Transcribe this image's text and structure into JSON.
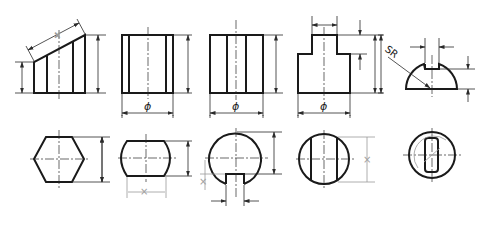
{
  "figures": [
    {
      "id": "truncated-prism-front",
      "row": 1,
      "col": 1,
      "description": "Front view of prism truncated by inclined plane, with slant and two height dimensions"
    },
    {
      "id": "cylinder-front-a",
      "row": 1,
      "col": 2,
      "label": "ϕ"
    },
    {
      "id": "cylinder-front-b",
      "row": 1,
      "col": 3,
      "label": "ϕ"
    },
    {
      "id": "stepped-cylinder-front",
      "row": 1,
      "col": 4,
      "label": "ϕ"
    },
    {
      "id": "hemisphere-slot-front",
      "row": 1,
      "col": 5,
      "label": "SR"
    },
    {
      "id": "hexagon-top",
      "row": 2,
      "col": 1
    },
    {
      "id": "cut-cylinder-top",
      "row": 2,
      "col": 2,
      "mark": "×"
    },
    {
      "id": "circle-slot-top",
      "row": 2,
      "col": 3,
      "mark": "×"
    },
    {
      "id": "circle-chords-top",
      "row": 2,
      "col": 4,
      "mark": "×"
    },
    {
      "id": "circle-slot-vertical-top",
      "row": 2,
      "col": 5
    }
  ],
  "labels": {
    "phi": "ϕ",
    "sr": "SR",
    "cross": "×"
  },
  "colors": {
    "outline": "#1a1a1a",
    "thin": "#2a2a2a",
    "erased": "#9a9a9a",
    "background": "#ffffff"
  }
}
